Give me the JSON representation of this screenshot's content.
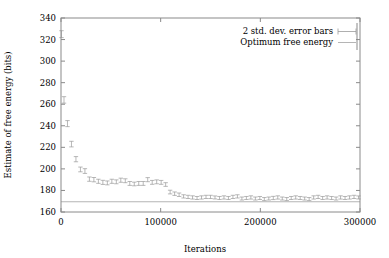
{
  "chart_data": {
    "type": "scatter",
    "title": "",
    "xlabel": "Iterations",
    "ylabel": "Estimate of free energy (bits)",
    "xlim": [
      0,
      300000
    ],
    "ylim": [
      160,
      340
    ],
    "xticks": [
      0,
      100000,
      200000,
      300000
    ],
    "xtick_labels": [
      "0",
      "100000",
      "200000",
      "300000"
    ],
    "yticks": [
      160,
      180,
      200,
      220,
      240,
      260,
      280,
      300,
      320,
      340
    ],
    "ytick_labels": [
      "160",
      "180",
      "200",
      "220",
      "240",
      "260",
      "280",
      "300",
      "320",
      "340"
    ],
    "grid": false,
    "legend_position": "top-right",
    "series": [
      {
        "name": "2 std. dev. error bars",
        "marker": "errorbar",
        "color": "#9a9a9a",
        "x": [
          500,
          3000,
          6500,
          10500,
          15000,
          19500,
          24000,
          28500,
          33000,
          37500,
          42000,
          46500,
          51000,
          55500,
          60000,
          64500,
          69000,
          73500,
          78000,
          82500,
          87000,
          91500,
          96000,
          100500,
          105000,
          109500,
          114000,
          118500,
          123000,
          127500,
          132000,
          136500,
          141000,
          145500,
          150000,
          154500,
          159000,
          163500,
          168000,
          172500,
          177000,
          181500,
          186000,
          190500,
          195000,
          199500,
          204000,
          208500,
          213000,
          217500,
          222000,
          226500,
          231000,
          235500,
          240000,
          244500,
          249000,
          253500,
          258000,
          262500,
          267000,
          271500,
          276000,
          280500,
          285000,
          289500,
          294000,
          298500
        ],
        "y": [
          325.0,
          264.0,
          242.0,
          223.0,
          209.0,
          199.5,
          198.0,
          190.5,
          190.0,
          188.5,
          187.5,
          187.0,
          188.5,
          188.0,
          189.5,
          189.0,
          186.5,
          186.0,
          186.5,
          186.5,
          190.0,
          187.5,
          188.0,
          187.5,
          185.5,
          178.5,
          177.0,
          176.0,
          174.5,
          174.0,
          173.5,
          173.0,
          173.5,
          174.0,
          174.0,
          173.5,
          173.0,
          173.5,
          173.0,
          174.0,
          174.5,
          172.5,
          173.0,
          173.5,
          172.5,
          173.0,
          172.0,
          172.5,
          173.0,
          173.5,
          172.5,
          172.0,
          173.0,
          173.5,
          173.0,
          172.5,
          172.0,
          173.5,
          174.0,
          173.0,
          173.5,
          173.0,
          172.5,
          173.5,
          173.0,
          173.5,
          174.0,
          173.5
        ],
        "yerr": [
          3.2,
          3.0,
          2.8,
          2.6,
          2.4,
          2.2,
          2.2,
          2.0,
          2.0,
          1.9,
          1.9,
          1.8,
          1.9,
          1.8,
          1.9,
          1.8,
          1.8,
          1.7,
          1.8,
          1.8,
          1.9,
          1.8,
          1.8,
          1.8,
          1.7,
          1.7,
          1.6,
          1.6,
          1.5,
          1.5,
          1.5,
          1.4,
          1.5,
          1.5,
          1.5,
          1.4,
          1.4,
          1.5,
          1.4,
          1.5,
          1.5,
          1.4,
          1.4,
          1.5,
          1.4,
          1.4,
          1.4,
          1.4,
          1.5,
          1.5,
          1.4,
          1.4,
          1.4,
          1.5,
          1.4,
          1.4,
          1.4,
          1.5,
          1.5,
          1.4,
          1.5,
          1.4,
          1.4,
          1.5,
          1.4,
          1.5,
          1.5,
          1.4
        ]
      },
      {
        "name": "Optimum free energy",
        "marker": "hline",
        "color": "#b5b5b5",
        "value": 169.5
      }
    ],
    "legend": [
      {
        "label": "2 std. dev. error bars",
        "sample": "errorbar"
      },
      {
        "label": "Optimum free energy",
        "sample": "line"
      }
    ]
  },
  "colors": {
    "frame": "#8a8a8a",
    "data": "#9a9a9a",
    "optimum": "#b5b5b5",
    "text": "#000000",
    "background": "#ffffff"
  }
}
